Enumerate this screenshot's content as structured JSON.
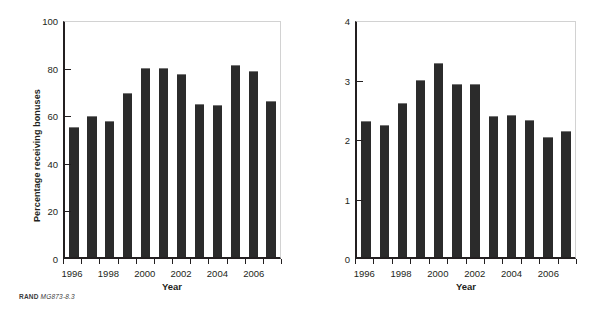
{
  "figure": {
    "source_note": {
      "brand": "RAND",
      "code": "MG873-8.3"
    },
    "bar_color": "#2b2b2b",
    "axis_color": "#231f20",
    "frame_color": "#d2d2d2"
  },
  "chart_data": [
    {
      "type": "bar",
      "title": "",
      "xlabel": "Year",
      "ylabel": "Percentage receiving bonuses",
      "ylim": [
        0,
        100
      ],
      "yticks": [
        0,
        20,
        40,
        60,
        80,
        100
      ],
      "ytick_labels": [
        "0",
        "20",
        "40",
        "60",
        "80",
        "100"
      ],
      "grid": false,
      "legend": "none",
      "categories": [
        "1996",
        "1997",
        "1998",
        "1999",
        "2000",
        "2001",
        "2002",
        "2003",
        "2004",
        "2005",
        "2006",
        "2007"
      ],
      "xtick_labels": [
        "1996",
        "1998",
        "2000",
        "2002",
        "2004",
        "2006"
      ],
      "values": [
        55.5,
        60.0,
        58.0,
        70.0,
        80.5,
        80.5,
        78.0,
        65.0,
        64.5,
        81.5,
        79.0,
        66.5
      ]
    },
    {
      "type": "bar",
      "title": "",
      "xlabel": "Year",
      "ylabel": "Average bonus step",
      "ylim": [
        0,
        4
      ],
      "yticks": [
        0,
        1,
        2,
        3,
        4
      ],
      "ytick_labels": [
        "0",
        "1",
        "2",
        "3",
        "4"
      ],
      "grid": false,
      "legend": "none",
      "categories": [
        "1996",
        "1997",
        "1998",
        "1999",
        "2000",
        "2001",
        "2002",
        "2003",
        "2004",
        "2005",
        "2006",
        "2007"
      ],
      "xtick_labels": [
        "1996",
        "1998",
        "2000",
        "2002",
        "2004",
        "2006"
      ],
      "values": [
        2.32,
        2.24,
        2.62,
        3.02,
        3.3,
        2.95,
        2.95,
        2.4,
        2.42,
        2.34,
        2.05,
        2.15
      ]
    }
  ]
}
